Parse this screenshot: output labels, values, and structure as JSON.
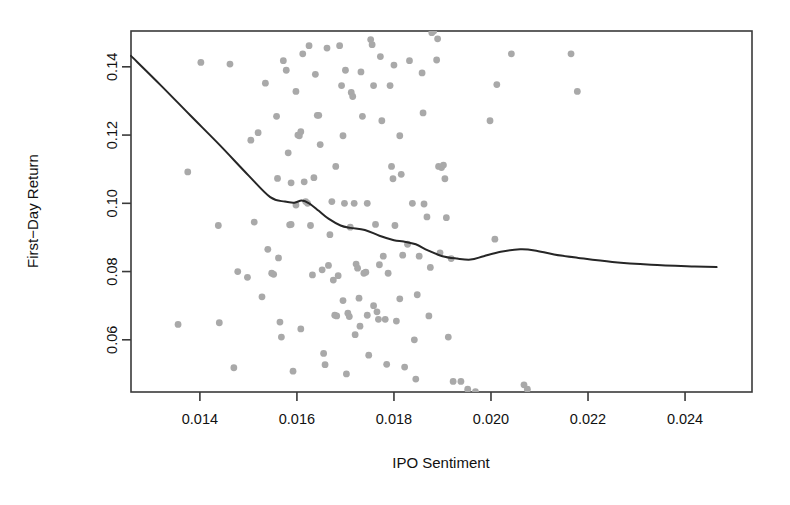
{
  "chart_data": {
    "type": "scatter",
    "title": "",
    "xlabel": "IPO Sentiment",
    "ylabel": "First−Day Return",
    "xlim": [
      0.01258,
      0.02538
    ],
    "ylim": [
      0.0447,
      0.1505
    ],
    "grid": false,
    "legend": null,
    "xticks": [
      0.014,
      0.016,
      0.018,
      0.02,
      0.022,
      0.024
    ],
    "xtick_labels": [
      "0.014",
      "0.016",
      "0.018",
      "0.020",
      "0.022",
      "0.024"
    ],
    "yticks": [
      0.06,
      0.08,
      0.1,
      0.12,
      0.14
    ],
    "ytick_labels": [
      "0.06",
      "0.08",
      "0.10",
      "0.12",
      "0.14"
    ],
    "point_color": "#a9a9a9",
    "point_size": 3.4,
    "line_color": "#262626",
    "frame_color": "#3a3a3a",
    "series": [
      {
        "name": "IPO observations",
        "type": "scatter",
        "points": [
          [
            0.01355,
            0.0645
          ],
          [
            0.01402,
            0.1413
          ],
          [
            0.01375,
            0.1092
          ],
          [
            0.01438,
            0.0935
          ],
          [
            0.01498,
            0.0783
          ],
          [
            0.01505,
            0.1185
          ],
          [
            0.0152,
            0.1207
          ],
          [
            0.01528,
            0.0726
          ],
          [
            0.01535,
            0.1352
          ],
          [
            0.0154,
            0.0865
          ],
          [
            0.01548,
            0.0795
          ],
          [
            0.01552,
            0.0792
          ],
          [
            0.01558,
            0.1255
          ],
          [
            0.0156,
            0.1073
          ],
          [
            0.01562,
            0.084
          ],
          [
            0.01565,
            0.0652
          ],
          [
            0.01568,
            0.0608
          ],
          [
            0.01572,
            0.1418
          ],
          [
            0.01578,
            0.139
          ],
          [
            0.01582,
            0.1148
          ],
          [
            0.01585,
            0.0937
          ],
          [
            0.01588,
            0.0938
          ],
          [
            0.01592,
            0.0508
          ],
          [
            0.01598,
            0.1328
          ],
          [
            0.01602,
            0.12
          ],
          [
            0.01605,
            0.1198
          ],
          [
            0.01608,
            0.0632
          ],
          [
            0.01612,
            0.1438
          ],
          [
            0.01615,
            0.1063
          ],
          [
            0.01618,
            0.1005
          ],
          [
            0.01622,
            0.1
          ],
          [
            0.01628,
            0.0935
          ],
          [
            0.01632,
            0.079
          ],
          [
            0.01638,
            0.1378
          ],
          [
            0.01642,
            0.1258
          ],
          [
            0.01645,
            0.1258
          ],
          [
            0.01648,
            0.1172
          ],
          [
            0.01652,
            0.0805
          ],
          [
            0.01655,
            0.056
          ],
          [
            0.01658,
            0.0527
          ],
          [
            0.01662,
            0.1455
          ],
          [
            0.01668,
            0.0908
          ],
          [
            0.01672,
            0.1005
          ],
          [
            0.01675,
            0.0775
          ],
          [
            0.01678,
            0.0672
          ],
          [
            0.01682,
            0.067
          ],
          [
            0.01688,
            0.1462
          ],
          [
            0.01692,
            0.1345
          ],
          [
            0.01695,
            0.1198
          ],
          [
            0.01698,
            0.1
          ],
          [
            0.01702,
            0.05
          ],
          [
            0.01705,
            0.0678
          ],
          [
            0.01708,
            0.0668
          ],
          [
            0.01712,
            0.1325
          ],
          [
            0.01715,
            0.1313
          ],
          [
            0.01718,
            0.1
          ],
          [
            0.01722,
            0.0822
          ],
          [
            0.01725,
            0.081
          ],
          [
            0.01728,
            0.0722
          ],
          [
            0.01732,
            0.1385
          ],
          [
            0.01735,
            0.1255
          ],
          [
            0.01738,
            0.0795
          ],
          [
            0.01742,
            0.0798
          ],
          [
            0.01745,
            0.0672
          ],
          [
            0.01748,
            0.0555
          ],
          [
            0.01752,
            0.148
          ],
          [
            0.01755,
            0.1465
          ],
          [
            0.01758,
            0.1345
          ],
          [
            0.01762,
            0.0938
          ],
          [
            0.01765,
            0.0682
          ],
          [
            0.01768,
            0.066
          ],
          [
            0.01772,
            0.143
          ],
          [
            0.01775,
            0.1242
          ],
          [
            0.01778,
            0.0845
          ],
          [
            0.01782,
            0.066
          ],
          [
            0.01785,
            0.0528
          ],
          [
            0.01792,
            0.1345
          ],
          [
            0.01795,
            0.1108
          ],
          [
            0.01798,
            0.1072
          ],
          [
            0.01802,
            0.0935
          ],
          [
            0.01805,
            0.0655
          ],
          [
            0.01812,
            0.1198
          ],
          [
            0.01815,
            0.1085
          ],
          [
            0.01818,
            0.0848
          ],
          [
            0.01822,
            0.052
          ],
          [
            0.01832,
            0.1418
          ],
          [
            0.01838,
            0.1
          ],
          [
            0.01842,
            0.06
          ],
          [
            0.01848,
            0.0732
          ],
          [
            0.01852,
            0.0845
          ],
          [
            0.01858,
            0.1382
          ],
          [
            0.01862,
            0.0998
          ],
          [
            0.01868,
            0.096
          ],
          [
            0.01872,
            0.067
          ],
          [
            0.01878,
            0.15
          ],
          [
            0.01882,
            0.1505
          ],
          [
            0.01888,
            0.142
          ],
          [
            0.01892,
            0.1108
          ],
          [
            0.01898,
            0.1105
          ],
          [
            0.01902,
            0.1112
          ],
          [
            0.01905,
            0.1072
          ],
          [
            0.01908,
            0.0958
          ],
          [
            0.01912,
            0.0608
          ],
          [
            0.01918,
            0.0838
          ],
          [
            0.01922,
            0.0478
          ],
          [
            0.01938,
            0.0478
          ],
          [
            0.01952,
            0.0455
          ],
          [
            0.01968,
            0.0448
          ],
          [
            0.01998,
            0.1242
          ],
          [
            0.02008,
            0.0895
          ],
          [
            0.02012,
            0.1348
          ],
          [
            0.02042,
            0.1438
          ],
          [
            0.02068,
            0.0468
          ],
          [
            0.02075,
            0.0455
          ],
          [
            0.02165,
            0.1438
          ],
          [
            0.02178,
            0.1328
          ],
          [
            0.01462,
            0.1408
          ],
          [
            0.01478,
            0.08
          ],
          [
            0.01512,
            0.0945
          ],
          [
            0.01588,
            0.106
          ],
          [
            0.01598,
            0.0995
          ],
          [
            0.01608,
            0.121
          ],
          [
            0.01625,
            0.1462
          ],
          [
            0.01635,
            0.1075
          ],
          [
            0.01665,
            0.0818
          ],
          [
            0.01685,
            0.0788
          ],
          [
            0.01695,
            0.0715
          ],
          [
            0.0171,
            0.093
          ],
          [
            0.0173,
            0.064
          ],
          [
            0.01745,
            0.1
          ],
          [
            0.01758,
            0.07
          ],
          [
            0.0177,
            0.082
          ],
          [
            0.01788,
            0.0795
          ],
          [
            0.018,
            0.1405
          ],
          [
            0.01812,
            0.072
          ],
          [
            0.01828,
            0.088
          ],
          [
            0.01845,
            0.0485
          ],
          [
            0.0186,
            0.1265
          ],
          [
            0.01875,
            0.0812
          ],
          [
            0.0189,
            0.1482
          ],
          [
            0.01895,
            0.0855
          ],
          [
            0.0144,
            0.065
          ],
          [
            0.0147,
            0.0518
          ],
          [
            0.0168,
            0.1108
          ],
          [
            0.017,
            0.139
          ],
          [
            0.0172,
            0.0615
          ]
        ]
      },
      {
        "name": "LOESS smooth",
        "type": "line",
        "points": [
          [
            0.01258,
            0.1432
          ],
          [
            0.0132,
            0.1345
          ],
          [
            0.0138,
            0.1258
          ],
          [
            0.0144,
            0.1172
          ],
          [
            0.015,
            0.1082
          ],
          [
            0.01545,
            0.1018
          ],
          [
            0.01575,
            0.1005
          ],
          [
            0.01595,
            0.1002
          ],
          [
            0.0161,
            0.1008
          ],
          [
            0.01625,
            0.1
          ],
          [
            0.01645,
            0.0978
          ],
          [
            0.01665,
            0.0955
          ],
          [
            0.0169,
            0.0935
          ],
          [
            0.0171,
            0.0928
          ],
          [
            0.0174,
            0.0922
          ],
          [
            0.0177,
            0.0905
          ],
          [
            0.018,
            0.0892
          ],
          [
            0.0182,
            0.0888
          ],
          [
            0.01845,
            0.088
          ],
          [
            0.0187,
            0.0862
          ],
          [
            0.019,
            0.0845
          ],
          [
            0.0193,
            0.0838
          ],
          [
            0.01958,
            0.0835
          ],
          [
            0.01985,
            0.0845
          ],
          [
            0.0202,
            0.0858
          ],
          [
            0.0206,
            0.0865
          ],
          [
            0.0209,
            0.0862
          ],
          [
            0.0213,
            0.085
          ],
          [
            0.0218,
            0.084
          ],
          [
            0.0225,
            0.0828
          ],
          [
            0.0233,
            0.082
          ],
          [
            0.0242,
            0.0815
          ],
          [
            0.02465,
            0.0813
          ]
        ]
      }
    ]
  }
}
